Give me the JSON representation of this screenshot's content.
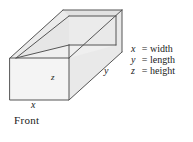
{
  "figure": {
    "caption": "Front",
    "edge_labels": {
      "x": "x",
      "y": "y",
      "z": "z"
    }
  },
  "legend": {
    "rows": [
      {
        "symbol": "x",
        "equals": "=",
        "word": "width"
      },
      {
        "symbol": "y",
        "equals": "=",
        "word": "length"
      },
      {
        "symbol": "z",
        "equals": "=",
        "word": "height"
      }
    ]
  },
  "colors": {
    "background": "#ffffff",
    "stroke": "#555555",
    "face_front": "#f4f4f4",
    "face_top_rim": "#ececec",
    "face_inner_side": "#e6e6e6",
    "face_inner_bottom": "#efefef",
    "face_right": "#e9e9e9",
    "text": "#1a1a1a"
  }
}
